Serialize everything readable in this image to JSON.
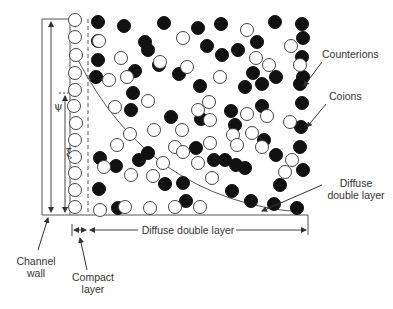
{
  "labels": {
    "counterions": "Counterions",
    "coions": "Coions",
    "diffuse_layer_line1": "Diffuse",
    "diffuse_layer_line2": "double layer",
    "diffuse_span": "Diffuse double layer",
    "channel_wall_line1": "Channel",
    "channel_wall_line2": "wall",
    "compact_line1": "Compact",
    "compact_line2": "layer",
    "psi": "ψ",
    "zeta": "ξ"
  },
  "colors": {
    "line": "#555555",
    "filled_ion": "#111111",
    "open_ion_stroke": "#444444"
  },
  "wall_column_open_ions": [
    [
      75,
      20
    ],
    [
      75,
      37
    ],
    [
      76,
      55
    ],
    [
      75,
      73
    ],
    [
      75,
      90
    ],
    [
      74,
      106
    ],
    [
      76,
      123
    ],
    [
      75,
      140
    ],
    [
      75,
      157
    ],
    [
      75,
      173
    ],
    [
      75,
      190
    ],
    [
      75,
      207
    ]
  ],
  "filled_ions": [
    [
      98,
      22
    ],
    [
      98,
      41
    ],
    [
      98,
      60
    ],
    [
      96,
      77
    ],
    [
      124,
      26
    ],
    [
      145,
      42
    ],
    [
      164,
      23
    ],
    [
      159,
      65
    ],
    [
      135,
      71
    ],
    [
      148,
      50
    ],
    [
      198,
      28
    ],
    [
      221,
      24
    ],
    [
      222,
      55
    ],
    [
      207,
      46
    ],
    [
      179,
      74
    ],
    [
      200,
      86
    ],
    [
      238,
      50
    ],
    [
      257,
      42
    ],
    [
      275,
      22
    ],
    [
      253,
      73
    ],
    [
      276,
      77
    ],
    [
      302,
      24
    ],
    [
      303,
      38
    ],
    [
      302,
      57
    ],
    [
      303,
      77
    ],
    [
      302,
      103
    ],
    [
      301,
      127
    ],
    [
      300,
      147
    ],
    [
      303,
      170
    ],
    [
      297,
      208
    ],
    [
      245,
      87
    ],
    [
      201,
      119
    ],
    [
      231,
      111
    ],
    [
      262,
      106
    ],
    [
      262,
      84
    ],
    [
      300,
      84
    ],
    [
      133,
      93
    ],
    [
      171,
      117
    ],
    [
      196,
      148
    ],
    [
      264,
      140
    ],
    [
      235,
      125
    ],
    [
      214,
      160
    ],
    [
      245,
      168
    ],
    [
      276,
      155
    ],
    [
      280,
      185
    ],
    [
      232,
      191
    ],
    [
      251,
      201
    ],
    [
      225,
      160
    ],
    [
      183,
      183
    ],
    [
      131,
      110
    ],
    [
      100,
      158
    ],
    [
      116,
      166
    ],
    [
      148,
      153
    ],
    [
      165,
      184
    ],
    [
      99,
      189
    ],
    [
      118,
      208
    ],
    [
      186,
      201
    ],
    [
      139,
      160
    ],
    [
      274,
      204
    ],
    [
      236,
      165
    ]
  ],
  "open_ions": [
    [
      99,
      41
    ],
    [
      121,
      58
    ],
    [
      127,
      77
    ],
    [
      109,
      80
    ],
    [
      160,
      62
    ],
    [
      183,
      38
    ],
    [
      247,
      30
    ],
    [
      187,
      67
    ],
    [
      220,
      77
    ],
    [
      256,
      58
    ],
    [
      269,
      65
    ],
    [
      291,
      46
    ],
    [
      115,
      107
    ],
    [
      148,
      101
    ],
    [
      210,
      120
    ],
    [
      247,
      114
    ],
    [
      267,
      116
    ],
    [
      233,
      135
    ],
    [
      290,
      122
    ],
    [
      198,
      110
    ],
    [
      182,
      130
    ],
    [
      209,
      102
    ],
    [
      117,
      145
    ],
    [
      130,
      134
    ],
    [
      154,
      130
    ],
    [
      175,
      147
    ],
    [
      198,
      163
    ],
    [
      163,
      163
    ],
    [
      104,
      167
    ],
    [
      131,
      175
    ],
    [
      183,
      152
    ],
    [
      262,
      147
    ],
    [
      292,
      160
    ],
    [
      100,
      210
    ],
    [
      125,
      207
    ],
    [
      150,
      208
    ],
    [
      175,
      207
    ],
    [
      200,
      207
    ],
    [
      153,
      176
    ],
    [
      210,
      143
    ],
    [
      252,
      133
    ],
    [
      237,
      145
    ],
    [
      285,
      172
    ],
    [
      212,
      178
    ],
    [
      300,
      65
    ]
  ]
}
